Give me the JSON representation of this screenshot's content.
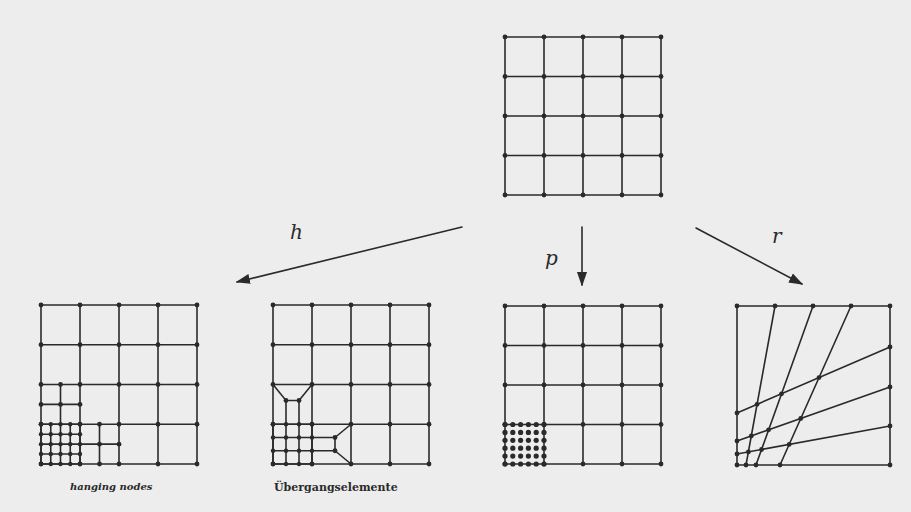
{
  "diagram": {
    "colors": {
      "background": "#ededed",
      "ink": "#2a2a2a"
    },
    "source_mesh": {
      "label": "uniform 4x4 mesh",
      "x0": 505,
      "y0": 37,
      "x1": 661,
      "y1": 195,
      "cells": 4
    },
    "arrows": [
      {
        "id": "h",
        "label": "h",
        "from": [
          462,
          227
        ],
        "to": [
          237,
          282
        ],
        "label_pos": [
          290,
          222
        ]
      },
      {
        "id": "p",
        "label": "p",
        "from": [
          582,
          227
        ],
        "to": [
          582,
          285
        ],
        "label_pos": [
          545,
          248
        ]
      },
      {
        "id": "r",
        "label": "r",
        "from": [
          696,
          228
        ],
        "to": [
          802,
          284
        ],
        "label_pos": [
          772,
          226
        ]
      }
    ],
    "meshes": [
      {
        "id": "h-hanging",
        "caption": "hanging nodes",
        "x0": 41,
        "y0": 305,
        "x1": 197,
        "y1": 464,
        "caption_pos": [
          70,
          482
        ]
      },
      {
        "id": "h-transition",
        "caption": "Übergangselemente",
        "x0": 273,
        "y0": 305,
        "x1": 429,
        "y1": 464,
        "caption_pos": [
          274,
          482
        ]
      },
      {
        "id": "p-refined",
        "caption": "",
        "x0": 505,
        "y0": 306,
        "x1": 661,
        "y1": 464,
        "high_order_nodes": "6x6"
      },
      {
        "id": "r-refined",
        "caption": "",
        "x0": 737,
        "y0": 306,
        "x1": 890,
        "y1": 465
      }
    ],
    "r_mesh_lines": {
      "steep": [
        [
          [
            775,
            306
          ],
          [
            746,
            465
          ]
        ],
        [
          [
            813,
            306
          ],
          [
            756,
            465
          ]
        ],
        [
          [
            851,
            306
          ],
          [
            780,
            465
          ]
        ]
      ],
      "shallow": [
        [
          [
            737,
            413
          ],
          [
            890,
            347
          ]
        ],
        [
          [
            737,
            441
          ],
          [
            890,
            387
          ]
        ],
        [
          [
            737,
            454
          ],
          [
            890,
            426
          ]
        ]
      ]
    }
  }
}
